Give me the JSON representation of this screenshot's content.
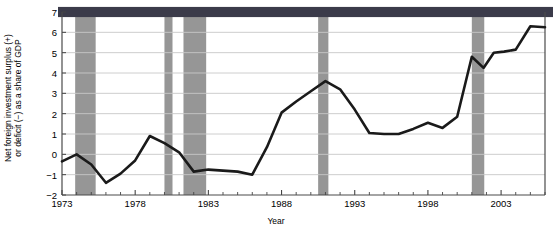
{
  "chart_data": {
    "type": "line",
    "title": "",
    "xlabel": "Year",
    "ylabel": "Net foreign investment surplus (+)\nor deficit (−) as a share of GDP",
    "xlim": [
      1973,
      2006
    ],
    "ylim": [
      -2,
      7
    ],
    "ytick_labels": [
      "7",
      "6",
      "5",
      "4",
      "3",
      "2",
      "1",
      "0",
      "−1",
      "−2"
    ],
    "ytick_values": [
      7,
      6,
      5,
      4,
      3,
      2,
      1,
      0,
      -1,
      -2
    ],
    "xtick_labels": [
      "1973",
      "1978",
      "1983",
      "1988",
      "1993",
      "1998",
      "2003"
    ],
    "xtick_values": [
      1973,
      1978,
      1983,
      1988,
      1993,
      1998,
      2003
    ],
    "minor_xtick_interval": 1,
    "grid": "horizontal",
    "legend": "none",
    "line_color": "#1a1a1a",
    "line_width": 2.6,
    "recession_band_color": "#969696",
    "top_band_color": "#3b3b4a",
    "plot_background": "#ffffff",
    "grid_color": "#c8c8c8",
    "axis_color": "#555555",
    "x": [
      1973,
      1974,
      1975,
      1976,
      1977,
      1978,
      1979,
      1980,
      1981,
      1982,
      1983,
      1984,
      1985,
      1986,
      1987,
      1988,
      1989,
      1990,
      1991,
      1992,
      1993,
      1994,
      1995,
      1996,
      1997,
      1998,
      1999,
      2000,
      2001,
      2002,
      2003,
      2004,
      2005,
      2006
    ],
    "values": [
      -0.35,
      0.0,
      -0.5,
      -1.4,
      -0.95,
      -0.3,
      0.9,
      0.55,
      0.1,
      -0.85,
      -0.75,
      -0.8,
      -0.85,
      -1.0,
      0.35,
      2.05,
      2.6,
      3.1,
      3.6,
      3.2,
      2.2,
      1.05,
      1.0,
      1.0,
      1.25,
      1.55,
      1.3,
      1.85,
      1.55,
      1.95,
      2.6,
      1.8,
      0.9,
      2.5
    ],
    "values_tail": [
      2.5,
      4.8,
      4.25,
      5.0,
      5.05,
      5.15,
      6.3,
      6.25
    ],
    "x_tail": [
      2000.5,
      2001,
      2001.8,
      2002.5,
      2003.2,
      2004,
      2005,
      2006
    ],
    "recession_bands": [
      {
        "start": 1973.9,
        "end": 1975.3
      },
      {
        "start": 1980.0,
        "end": 1980.55
      },
      {
        "start": 1981.3,
        "end": 1982.85
      },
      {
        "start": 1990.5,
        "end": 1991.2
      },
      {
        "start": 2001.0,
        "end": 2001.85
      }
    ],
    "top_band": {
      "start": 1973,
      "end": 2006,
      "from": 6.75,
      "to": 7.25
    }
  }
}
